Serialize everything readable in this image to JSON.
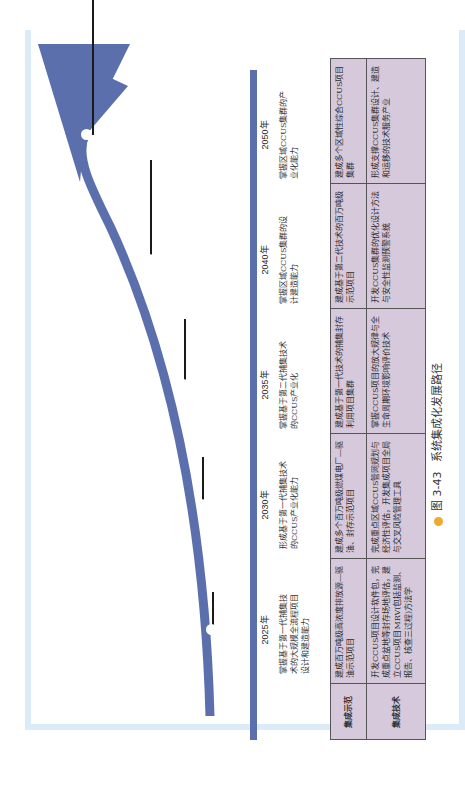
{
  "figure": {
    "caption_number": "图 3-43",
    "caption_title": "系统集成化发展路径"
  },
  "colors": {
    "arrow": "#5b6fad",
    "axis": "#5b6fad",
    "table_fill": "#d6c9dc",
    "frame": "#dcebf8",
    "caption_bullet": "#f0a830"
  },
  "timeline": {
    "milestones": [
      {
        "year": "2025年",
        "goal": "掌握基于第一代捕集技术的大规模全流程项目设计和建造能力"
      },
      {
        "year": "2030年",
        "goal": "形成基于第一代捕集技术的CCUS产业化能力"
      },
      {
        "year": "2035年",
        "goal": "掌握基于第二代捕集技术的CCUS产业化"
      },
      {
        "year": "2040年",
        "goal": "掌握区域CCUS集群的设计建造能力"
      },
      {
        "year": "2050年",
        "goal": "掌握区域CCUS集群的产业化能力"
      }
    ]
  },
  "table": {
    "rows": [
      {
        "header": "集成示范",
        "cells": [
          "建成百万吨级高浓度排放源—驱油示范项目",
          "建成多个百万吨级燃煤电厂—驱油、封存示范项目",
          "建成基于第一代技术的捕集封存利用项目集群",
          "建成基于第二代技术的百万吨级示范项目",
          "建成多个区域性综合CCUS项目集群"
        ]
      },
      {
        "header": "集成技术",
        "cells": [
          "开发CCUS项目设计软件包，完成重点盆地等封存场地评估，建立CCUS项目MRV(包括监测、报告、核查三过程)方法学",
          "完成重点区域CCUS管网规划与经济性评估，开发集成项目全局与交叉风险管理工具",
          "掌握CCUS项目的放大规律与全生命周期环境影响评价技术",
          "开发CCUS集群的优化设计方法与安全性监测预警系统",
          "形成支撑CCUS集群设计、建造和运移的技术服务产业"
        ]
      }
    ]
  }
}
